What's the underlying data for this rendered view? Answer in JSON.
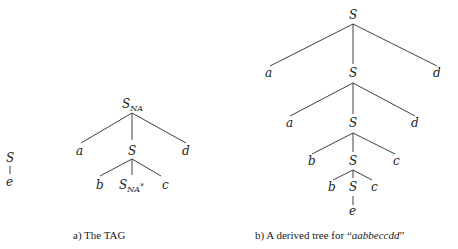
{
  "figure": {
    "part_a": {
      "caption": "a) The TAG",
      "initial_tree": {
        "root": "S",
        "child": "e"
      },
      "auxiliary_tree": {
        "root": "S",
        "root_subscript": "NA",
        "level1": [
          "a",
          "S",
          "d"
        ],
        "level2": [
          "b",
          "S",
          "c"
        ],
        "foot_subscript": "NA",
        "foot_marker": "*"
      }
    },
    "part_b": {
      "caption_prefix": "b) A derived tree for ",
      "caption_open_quote": "“",
      "caption_string": "aabbeccdd",
      "caption_close_quote": "”",
      "derived_tree": {
        "root": "S",
        "level1": [
          "a",
          "S",
          "d"
        ],
        "level2": [
          "a",
          "S",
          "d"
        ],
        "level3": [
          "b",
          "S",
          "c"
        ],
        "level4": [
          "b",
          "S",
          "c"
        ],
        "leaf": "e"
      }
    }
  }
}
